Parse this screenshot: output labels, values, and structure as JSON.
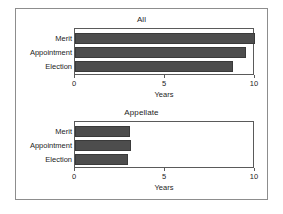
{
  "figure": {
    "background": "#ffffff",
    "frame_color": "#8d8d8d",
    "bar_color": "#4d4d4d",
    "axis_color": "#5a5a5a",
    "text_color": "#1c1c1c"
  },
  "panels": [
    {
      "title": "All",
      "xlabel": "Years",
      "categories": [
        "Merit",
        "Appointment",
        "Election"
      ],
      "values": [
        10.0,
        9.5,
        8.8
      ],
      "ticks": [
        {
          "value": 0,
          "label": "0"
        },
        {
          "value": 5,
          "label": "5"
        },
        {
          "value": 10,
          "label": "10"
        }
      ]
    },
    {
      "title": "Appellate",
      "xlabel": "Years",
      "categories": [
        "Merit",
        "Appointment",
        "Election"
      ],
      "values": [
        3.05,
        3.1,
        2.95
      ],
      "ticks": [
        {
          "value": 0,
          "label": "0"
        },
        {
          "value": 5,
          "label": "5"
        },
        {
          "value": 10,
          "label": "10"
        }
      ]
    }
  ],
  "chart_data": {
    "type": "bar",
    "orientation": "horizontal",
    "title": "",
    "xlabel": "Years",
    "ylabel": "",
    "xlim": [
      0,
      10
    ],
    "xticks": [
      0,
      5,
      10
    ],
    "grid": false,
    "legend": "none",
    "categories": [
      "Merit",
      "Appointment",
      "Election"
    ],
    "panels": [
      {
        "title": "All",
        "categories": [
          "Merit",
          "Appointment",
          "Election"
        ],
        "values": [
          10.0,
          9.5,
          8.8
        ],
        "xlabel": "Years",
        "xlim": [
          0,
          10
        ]
      },
      {
        "title": "Appellate",
        "categories": [
          "Merit",
          "Appointment",
          "Election"
        ],
        "values": [
          3.05,
          3.1,
          2.95
        ],
        "xlabel": "Years",
        "xlim": [
          0,
          10
        ]
      }
    ]
  }
}
